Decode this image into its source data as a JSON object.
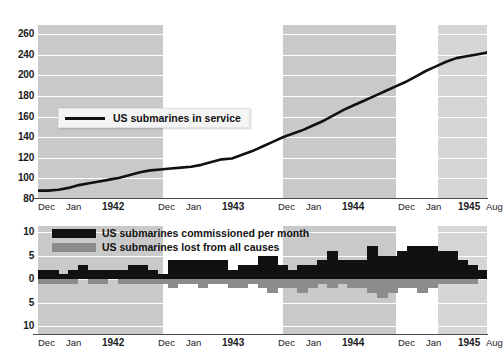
{
  "chart_data": [
    {
      "type": "line",
      "title": "US submarines in service",
      "xlabel": "",
      "ylabel": "",
      "ylim": [
        80,
        270
      ],
      "yticks": [
        260,
        240,
        200,
        180,
        160,
        140,
        120,
        100,
        80
      ],
      "grid": true,
      "legend_position": "inside-left",
      "legend": [
        "US submarines in service"
      ],
      "x_tick_labels": [
        "Dec",
        "Jan",
        "1942",
        "Dec",
        "Jan",
        "1943",
        "Dec",
        "Jan",
        "1944",
        "Dec",
        "Jan",
        "1945",
        "Aug"
      ],
      "x": [
        "1941-12",
        "1942-01",
        "1942-02",
        "1942-03",
        "1942-04",
        "1942-05",
        "1942-06",
        "1942-07",
        "1942-08",
        "1942-09",
        "1942-10",
        "1942-11",
        "1942-12",
        "1943-01",
        "1943-02",
        "1943-03",
        "1943-04",
        "1943-05",
        "1943-06",
        "1943-07",
        "1943-08",
        "1943-09",
        "1943-10",
        "1943-11",
        "1943-12",
        "1944-01",
        "1944-02",
        "1944-03",
        "1944-04",
        "1944-05",
        "1944-06",
        "1944-07",
        "1944-08",
        "1944-09",
        "1944-10",
        "1944-11",
        "1944-12",
        "1945-01",
        "1945-02",
        "1945-03",
        "1945-04",
        "1945-05",
        "1945-06",
        "1945-07",
        "1945-08"
      ],
      "values": [
        88,
        88,
        89,
        91,
        94,
        96,
        98,
        100,
        102,
        105,
        108,
        110,
        111,
        112,
        113,
        114,
        116,
        119,
        122,
        123,
        127,
        131,
        136,
        141,
        146,
        150,
        154,
        159,
        164,
        170,
        176,
        181,
        186,
        191,
        196,
        201,
        206,
        212,
        218,
        223,
        228,
        232,
        234,
        236,
        238
      ]
    },
    {
      "type": "bar",
      "title": "",
      "xlabel": "",
      "ylabel": "",
      "ylim": [
        -10,
        12
      ],
      "yticks": [
        10,
        5,
        0,
        5,
        10
      ],
      "ytick_note": "axis is diverging: values above zero are commissioned, below zero are losses; both sides labelled as positive magnitudes",
      "grid": true,
      "legend_position": "top-left",
      "x_tick_labels": [
        "Dec",
        "Jan",
        "1942",
        "Dec",
        "Jan",
        "1943",
        "Dec",
        "Jan",
        "1944",
        "Dec",
        "Jan",
        "1945",
        "Aug"
      ],
      "categories": [
        "1941-12",
        "1942-01",
        "1942-02",
        "1942-03",
        "1942-04",
        "1942-05",
        "1942-06",
        "1942-07",
        "1942-08",
        "1942-09",
        "1942-10",
        "1942-11",
        "1942-12",
        "1943-01",
        "1943-02",
        "1943-03",
        "1943-04",
        "1943-05",
        "1943-06",
        "1943-07",
        "1943-08",
        "1943-09",
        "1943-10",
        "1943-11",
        "1943-12",
        "1944-01",
        "1944-02",
        "1944-03",
        "1944-04",
        "1944-05",
        "1944-06",
        "1944-07",
        "1944-08",
        "1944-09",
        "1944-10",
        "1944-11",
        "1944-12",
        "1945-01",
        "1945-02",
        "1945-03",
        "1945-04",
        "1945-05",
        "1945-06",
        "1945-07",
        "1945-08"
      ],
      "series": [
        {
          "name": "US submarines commissioned per month",
          "color": "#111111",
          "direction": "up",
          "values": [
            2,
            2,
            1,
            2,
            3,
            2,
            2,
            2,
            2,
            3,
            3,
            2,
            1,
            4,
            4,
            4,
            4,
            4,
            4,
            2,
            3,
            3,
            5,
            5,
            3,
            2,
            3,
            3,
            4,
            6,
            4,
            4,
            4,
            7,
            5,
            5,
            6,
            7,
            7,
            7,
            6,
            6,
            4,
            3,
            2
          ]
        },
        {
          "name": "US submarines lost from all causes",
          "color": "#8c8c8c",
          "direction": "down",
          "values": [
            1,
            1,
            1,
            1,
            0,
            1,
            1,
            0,
            1,
            1,
            1,
            1,
            1,
            2,
            1,
            1,
            2,
            1,
            1,
            2,
            2,
            1,
            2,
            3,
            2,
            2,
            3,
            2,
            1,
            2,
            1,
            2,
            2,
            3,
            4,
            3,
            2,
            2,
            3,
            2,
            1,
            1,
            1,
            1,
            0
          ]
        }
      ]
    }
  ],
  "top_chart": {
    "yticks": [
      "260",
      "240",
      "200",
      "180",
      "160",
      "140",
      "120",
      "100",
      "80"
    ],
    "legend_label": "US submarines in service"
  },
  "bottom_chart": {
    "yticks": [
      "10",
      "5",
      "0",
      "5",
      "10"
    ],
    "legend": {
      "commissioned_label": "US submarines commissioned per month",
      "lost_label": "US submarines lost from all causes"
    }
  },
  "xaxis": {
    "ticks": [
      {
        "label": "Dec",
        "kind": "mon"
      },
      {
        "label": "Jan",
        "kind": "mon"
      },
      {
        "label": "1942",
        "kind": "yr"
      },
      {
        "label": "Dec",
        "kind": "mon"
      },
      {
        "label": "Jan",
        "kind": "mon"
      },
      {
        "label": "1943",
        "kind": "yr"
      },
      {
        "label": "Dec",
        "kind": "mon"
      },
      {
        "label": "Jan",
        "kind": "mon"
      },
      {
        "label": "1944",
        "kind": "yr"
      },
      {
        "label": "Dec",
        "kind": "mon"
      },
      {
        "label": "Jan",
        "kind": "mon"
      },
      {
        "label": "1945",
        "kind": "yr"
      },
      {
        "label": "Aug",
        "kind": "mon"
      }
    ]
  },
  "colors": {
    "band": "#c9c9c9",
    "band_light": "#d6d6d6",
    "line": "#111111",
    "commissioned": "#111111",
    "lost": "#8c8c8c",
    "axis": "#4a4a4a",
    "grid": "#ffffff",
    "background": "#ffffff"
  }
}
